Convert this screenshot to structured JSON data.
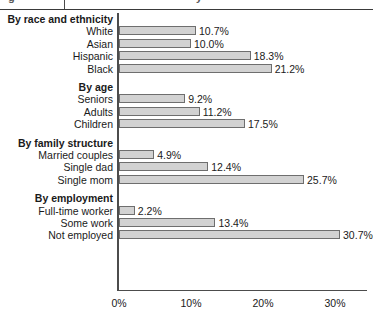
{
  "title_strip": {
    "ghost_left": "g",
    "ghost_right": "y"
  },
  "chart_data": {
    "type": "bar",
    "orientation": "horizontal",
    "title": "",
    "xlabel": "",
    "ylabel": "",
    "xlim": [
      0,
      33
    ],
    "grid": false,
    "legend": false,
    "value_suffix": "%",
    "xticks": [
      "0%",
      "10%",
      "20%",
      "30%"
    ],
    "xtick_values": [
      0,
      10,
      20,
      30
    ],
    "groups": [
      {
        "header": "By race and ethnicity",
        "categories": [
          "White",
          "Asian",
          "Hispanic",
          "Black"
        ],
        "values": [
          10.7,
          10.0,
          18.3,
          21.2
        ],
        "labels": [
          "10.7%",
          "10.0%",
          "18.3%",
          "21.2%"
        ]
      },
      {
        "header": "By age",
        "categories": [
          "Seniors",
          "Adults",
          "Children"
        ],
        "values": [
          9.2,
          11.2,
          17.5
        ],
        "labels": [
          "9.2%",
          "11.2%",
          "17.5%"
        ]
      },
      {
        "header": "By family structure",
        "categories": [
          "Married couples",
          "Single dad",
          "Single mom"
        ],
        "values": [
          4.9,
          12.4,
          25.7
        ],
        "labels": [
          "4.9%",
          "12.4%",
          "25.7%"
        ]
      },
      {
        "header": "By employment",
        "categories": [
          "Full-time worker",
          "Some work",
          "Not employed"
        ],
        "values": [
          2.2,
          13.4,
          30.7
        ],
        "labels": [
          "2.2%",
          "13.4%",
          "30.7%"
        ]
      }
    ],
    "colors": {
      "bar_fill": "#d2d2d2",
      "bar_border": "#6e6e6e",
      "axis": "#4c4c4c",
      "text": "#1a1a1a"
    }
  }
}
